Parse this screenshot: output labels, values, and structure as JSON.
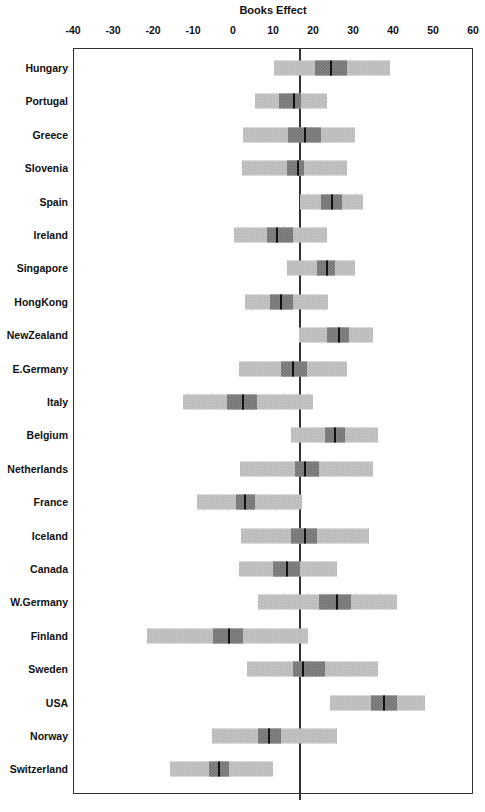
{
  "chart_data": {
    "type": "bar",
    "subtype": "forest-plot",
    "title": "Books Effect",
    "xlabel": "",
    "ylabel": "",
    "xlim": [
      -40,
      60
    ],
    "xticks": [
      -40,
      -30,
      -20,
      -10,
      0,
      10,
      20,
      30,
      40,
      50,
      60
    ],
    "xtick_labels": [
      "-40",
      "-30",
      "-20",
      "-10",
      "0",
      "10",
      "20",
      "30",
      "40",
      "50",
      "60"
    ],
    "grid": false,
    "legend": null,
    "reference_line": 16.8,
    "categories": [
      "Hungary",
      "Portugal",
      "Greece",
      "Slovenia",
      "Spain",
      "Ireland",
      "Singapore",
      "HongKong",
      "NewZealand",
      "E.Germany",
      "Italy",
      "Belgium",
      "Netherlands",
      "France",
      "Iceland",
      "Canada",
      "W.Germany",
      "Finland",
      "Sweden",
      "USA",
      "Norway",
      "Switzerland"
    ],
    "series": [
      {
        "name": "Books Effect estimate with inner and outer confidence intervals",
        "points": [
          {
            "label": "Hungary",
            "estimate": 24.5,
            "inner_low": 20.5,
            "inner_high": 28.5,
            "outer_low": 10.3,
            "outer_high": 39.3
          },
          {
            "label": "Portugal",
            "estimate": 15.3,
            "inner_low": 11.5,
            "inner_high": 17.0,
            "outer_low": 5.5,
            "outer_high": 23.5
          },
          {
            "label": "Greece",
            "estimate": 18.0,
            "inner_low": 13.8,
            "inner_high": 22.0,
            "outer_low": 2.5,
            "outer_high": 30.5
          },
          {
            "label": "Slovenia",
            "estimate": 16.3,
            "inner_low": 13.5,
            "inner_high": 17.8,
            "outer_low": 2.3,
            "outer_high": 28.5
          },
          {
            "label": "Spain",
            "estimate": 24.8,
            "inner_low": 22.0,
            "inner_high": 27.3,
            "outer_low": 16.8,
            "outer_high": 32.5
          },
          {
            "label": "Ireland",
            "estimate": 11.0,
            "inner_low": 8.5,
            "inner_high": 15.0,
            "outer_low": 0.3,
            "outer_high": 23.5
          },
          {
            "label": "Singapore",
            "estimate": 23.5,
            "inner_low": 21.0,
            "inner_high": 25.5,
            "outer_low": 13.5,
            "outer_high": 30.5
          },
          {
            "label": "HongKong",
            "estimate": 12.0,
            "inner_low": 9.3,
            "inner_high": 15.0,
            "outer_low": 3.0,
            "outer_high": 23.8
          },
          {
            "label": "NewZealand",
            "estimate": 26.5,
            "inner_low": 23.5,
            "inner_high": 29.0,
            "outer_low": 16.5,
            "outer_high": 35.0
          },
          {
            "label": "E.Germany",
            "estimate": 15.0,
            "inner_low": 12.0,
            "inner_high": 18.5,
            "outer_low": 1.5,
            "outer_high": 28.5
          },
          {
            "label": "Italy",
            "estimate": 2.5,
            "inner_low": -1.5,
            "inner_high": 6.0,
            "outer_low": -12.5,
            "outer_high": 20.0
          },
          {
            "label": "Belgium",
            "estimate": 25.5,
            "inner_low": 23.0,
            "inner_high": 28.0,
            "outer_low": 14.5,
            "outer_high": 36.3
          },
          {
            "label": "Netherlands",
            "estimate": 18.0,
            "inner_low": 15.5,
            "inner_high": 21.5,
            "outer_low": 1.8,
            "outer_high": 35.0
          },
          {
            "label": "France",
            "estimate": 3.0,
            "inner_low": 0.8,
            "inner_high": 5.5,
            "outer_low": -9.0,
            "outer_high": 17.3
          },
          {
            "label": "Iceland",
            "estimate": 18.0,
            "inner_low": 14.5,
            "inner_high": 21.0,
            "outer_low": 2.0,
            "outer_high": 34.0
          },
          {
            "label": "Canada",
            "estimate": 13.5,
            "inner_low": 10.0,
            "inner_high": 16.8,
            "outer_low": 1.5,
            "outer_high": 26.0
          },
          {
            "label": "W.Germany",
            "estimate": 26.0,
            "inner_low": 21.5,
            "inner_high": 29.5,
            "outer_low": 6.3,
            "outer_high": 41.0
          },
          {
            "label": "Finland",
            "estimate": -1.0,
            "inner_low": -5.0,
            "inner_high": 2.5,
            "outer_low": -21.5,
            "outer_high": 18.8
          },
          {
            "label": "Sweden",
            "estimate": 17.5,
            "inner_low": 15.0,
            "inner_high": 23.0,
            "outer_low": 3.5,
            "outer_high": 36.3
          },
          {
            "label": "USA",
            "estimate": 37.8,
            "inner_low": 34.5,
            "inner_high": 41.0,
            "outer_low": 24.3,
            "outer_high": 48.0
          },
          {
            "label": "Norway",
            "estimate": 9.0,
            "inner_low": 6.3,
            "inner_high": 12.0,
            "outer_low": -5.3,
            "outer_high": 26.0
          },
          {
            "label": "Switzerland",
            "estimate": -3.5,
            "inner_low": -6.0,
            "inner_high": -1.0,
            "outer_low": -15.8,
            "outer_high": 10.0
          }
        ]
      }
    ],
    "colors": {
      "outer_interval": "#b4b4b4",
      "inner_interval": "#6e6e6e",
      "point_estimate": "#111111",
      "axis": "#333333",
      "background": "#ffffff"
    }
  },
  "layout": {
    "x_min": -40,
    "x_max": 60,
    "plot_left_px": 73,
    "plot_width_px": 400,
    "plot_top_px": 48,
    "row_first_y_px": 68,
    "row_step_px": 33.4
  }
}
